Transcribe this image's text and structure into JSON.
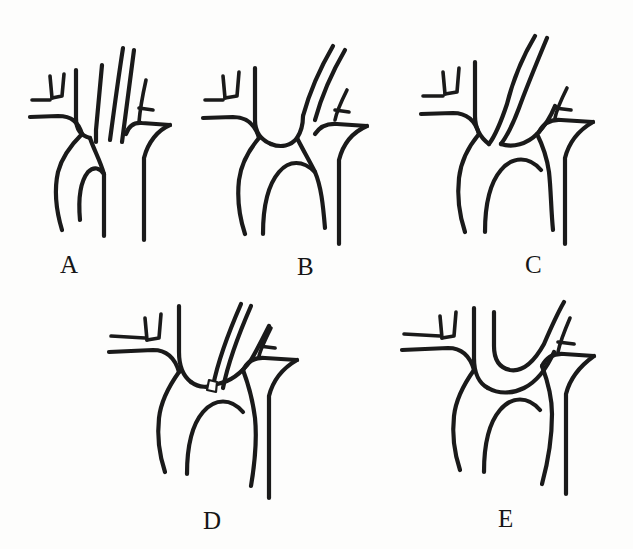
{
  "figure": {
    "background_color": "#fdfdfc",
    "line_color": "#1a1a1a",
    "caption": "",
    "panel_count": 5,
    "rows": 2
  },
  "panels": [
    {
      "id": "A",
      "label": "A",
      "description": "Normal three-vessel aortic arch with separate origins of the brachiocephalic trunk, left common carotid artery and left subclavian artery",
      "marker": "none"
    },
    {
      "id": "B",
      "label": "B",
      "description": "Left common carotid artery arising from the brachiocephalic trunk with a common origin",
      "marker": "none"
    },
    {
      "id": "C",
      "label": "C",
      "description": "Common origin of the brachiocephalic trunk and left common carotid artery from a single arch trunk",
      "marker": "none"
    },
    {
      "id": "D",
      "label": "D",
      "description": "Left common carotid artery arising directly from the aortic arch with a marked origin point",
      "marker": "origin-marker"
    },
    {
      "id": "E",
      "label": "E",
      "description": "Left common carotid artery arising from the brachiocephalic trunk with a looping U-shaped course",
      "marker": "none"
    }
  ],
  "labels": {
    "a": "A",
    "b": "B",
    "c": "C",
    "d": "D",
    "e": "E"
  }
}
